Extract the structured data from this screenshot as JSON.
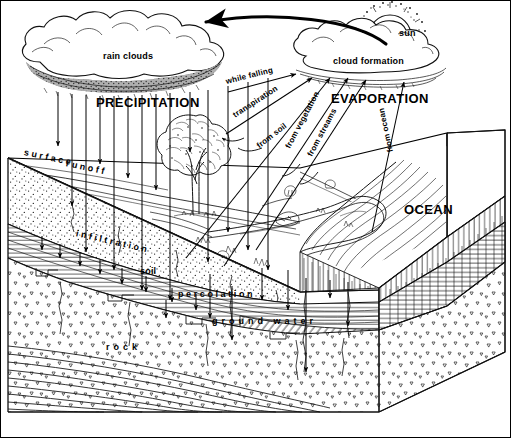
{
  "diagram": {
    "type": "water-cycle-block-diagram",
    "style": "pen-and-ink line engraving, black on white",
    "canvas": {
      "width": 511,
      "height": 438
    },
    "border_color": "#000000",
    "ink_color": "#000000",
    "paper_color": "#ffffff"
  },
  "labels": {
    "rain_clouds": "rain clouds",
    "precipitation": "PRECIPITATION",
    "while_falling": "while falling",
    "transpiration": "transpiration",
    "from_soil": "from soil",
    "from_vegetation": "from vegetation",
    "from_streams": "from streams",
    "from_ocean": "from ocean",
    "evaporation": "EVAPORATION",
    "cloud_formation": "cloud  formation",
    "sun": "sun",
    "ocean": "OCEAN",
    "surface": "surface",
    "runoff": "runoff",
    "infiltration": "infiltration",
    "soil": "soil",
    "percolation": "percolation",
    "ground_water": "ground water",
    "rock": "rock"
  },
  "features": [
    {
      "name": "rain-clouds",
      "kind": "cloud",
      "note": "large dark-bottomed cumulus mass upper left"
    },
    {
      "name": "cloud-formation",
      "kind": "cloud",
      "note": "lighter cumulus mass upper right"
    },
    {
      "name": "sun",
      "kind": "sun",
      "note": "radiating disc behind right cloud"
    },
    {
      "name": "tree",
      "kind": "vegetation",
      "note": "broadleaf tree at center-left of land surface"
    },
    {
      "name": "river",
      "kind": "water",
      "note": "meandering stream flowing right into ocean"
    },
    {
      "name": "ocean",
      "kind": "water",
      "note": "body of water occupying right third of block top"
    },
    {
      "name": "soil-layer",
      "kind": "stratum",
      "note": "stippled surface layer"
    },
    {
      "name": "ground-water-layer",
      "kind": "stratum",
      "note": "horizontal-ruled saturated zone"
    },
    {
      "name": "rock-layer",
      "kind": "stratum",
      "note": "triangle-speckled bedrock"
    },
    {
      "name": "bedded-strata",
      "kind": "stratum",
      "note": "wavy parallel bedding planes at base"
    }
  ],
  "arrows": {
    "precipitation_count": 14,
    "evaporation_count": 5,
    "infiltration_count": 8,
    "percolation_count": 7,
    "return_flow": "cloud formation to rain clouds (curved arrow, right to left)"
  }
}
